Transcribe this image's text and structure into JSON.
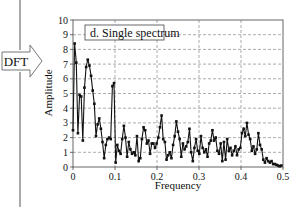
{
  "side": {
    "arrow_label": "DFT"
  },
  "chart_data": {
    "type": "line",
    "title": "d.  Single spectrum",
    "xlabel": "Frequency",
    "ylabel": "Amplitude",
    "xlim": [
      0,
      0.5
    ],
    "ylim": [
      0,
      10
    ],
    "xticks": [
      "0",
      "0.1",
      "0.2",
      "0.3",
      "0.4",
      "0.5"
    ],
    "xtick_values": [
      0,
      0.1,
      0.2,
      0.3,
      0.4,
      0.5
    ],
    "yticks": [
      "0",
      "1",
      "2",
      "3",
      "4",
      "5",
      "6",
      "7",
      "8",
      "9",
      "10"
    ],
    "ytick_values": [
      0,
      1,
      2,
      3,
      4,
      5,
      6,
      7,
      8,
      9,
      10
    ],
    "grid": true,
    "legend": "none",
    "marker": "square",
    "series": [
      {
        "name": "Single spectrum",
        "x": [
          0,
          0.0039,
          0.0078,
          0.0117,
          0.0156,
          0.0195,
          0.0234,
          0.0273,
          0.0313,
          0.0352,
          0.0391,
          0.043,
          0.0469,
          0.0508,
          0.0547,
          0.0586,
          0.0625,
          0.0664,
          0.0703,
          0.0742,
          0.0781,
          0.082,
          0.0859,
          0.0898,
          0.0938,
          0.0977,
          0.1016,
          0.1055,
          0.1094,
          0.1133,
          0.1172,
          0.1211,
          0.125,
          0.1289,
          0.1328,
          0.1367,
          0.1406,
          0.1445,
          0.1484,
          0.1523,
          0.1563,
          0.1602,
          0.1641,
          0.168,
          0.1719,
          0.1758,
          0.1797,
          0.1836,
          0.1875,
          0.1914,
          0.1953,
          0.1992,
          0.2031,
          0.207,
          0.2109,
          0.2148,
          0.2188,
          0.2227,
          0.2266,
          0.2305,
          0.2344,
          0.2383,
          0.2422,
          0.2461,
          0.25,
          0.2539,
          0.2578,
          0.2617,
          0.2656,
          0.2695,
          0.2734,
          0.2773,
          0.2813,
          0.2852,
          0.2891,
          0.293,
          0.2969,
          0.3008,
          0.3047,
          0.3086,
          0.3125,
          0.3164,
          0.3203,
          0.3242,
          0.3281,
          0.332,
          0.3359,
          0.3398,
          0.3438,
          0.3477,
          0.3516,
          0.3555,
          0.3594,
          0.3633,
          0.3672,
          0.3711,
          0.375,
          0.3789,
          0.3828,
          0.3867,
          0.3906,
          0.3945,
          0.3984,
          0.4023,
          0.4063,
          0.4102,
          0.4141,
          0.418,
          0.4219,
          0.4258,
          0.4297,
          0.4336,
          0.4375,
          0.4414,
          0.4453,
          0.4492,
          0.4531,
          0.457,
          0.4609,
          0.4648,
          0.4688,
          0.4727,
          0.4766,
          0.4805,
          0.4844,
          0.4883,
          0.4922,
          0.4961
        ],
        "values": [
          2.5,
          8.4,
          7.1,
          2.3,
          4.9,
          4.8,
          1.8,
          5.4,
          6.8,
          7.3,
          6.9,
          6.2,
          5.2,
          4.3,
          2.1,
          2.9,
          3.3,
          2.6,
          1.7,
          0.6,
          1.5,
          1.9,
          2.0,
          1.9,
          5.5,
          5.7,
          0.3,
          1.5,
          1.1,
          0.9,
          1.9,
          2.8,
          2.0,
          0.7,
          1.7,
          1.2,
          0.9,
          1.0,
          0.8,
          2.1,
          0.4,
          0.6,
          1.9,
          2.7,
          2.5,
          1.6,
          1.8,
          0.9,
          1.6,
          1.6,
          1.3,
          1.6,
          2.0,
          2.7,
          3.5,
          1.9,
          1.7,
          0.5,
          0.8,
          1.0,
          0.6,
          1.5,
          2.1,
          3.1,
          2.4,
          1.9,
          0.7,
          1.6,
          1.2,
          1.4,
          1.7,
          2.6,
          1.0,
          0.4,
          1.3,
          1.9,
          1.1,
          0.9,
          2.1,
          1.3,
          1.0,
          1.2,
          0.7,
          1.6,
          1.8,
          2.5,
          1.8,
          2.0,
          1.1,
          0.9,
          1.6,
          0.4,
          1.7,
          0.5,
          1.9,
          1.1,
          1.3,
          0.8,
          1.1,
          1.4,
          0.8,
          1.2,
          1.3,
          2.3,
          2.6,
          2.1,
          3.0,
          2.2,
          1.9,
          1.1,
          1.4,
          0.9,
          1.2,
          2.3,
          1.5,
          1.2,
          0.5,
          0.3,
          0.6,
          0.4,
          0.3,
          0.4,
          0.2,
          0.2,
          0.15,
          0.1,
          0.05,
          0.1
        ]
      }
    ]
  }
}
